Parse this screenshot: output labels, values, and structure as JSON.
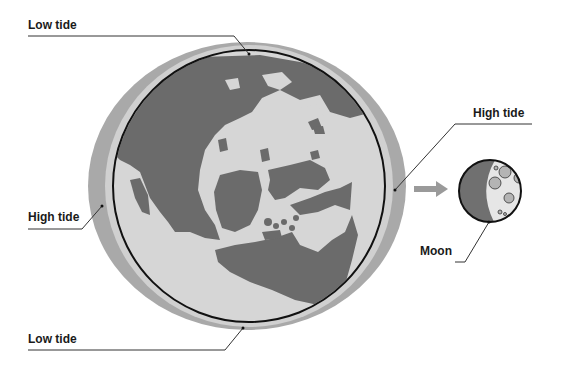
{
  "diagram": {
    "labels": {
      "low_tide_top": "Low tide",
      "high_tide_left": "High tide",
      "high_tide_right": "High tide",
      "low_tide_bottom": "Low tide",
      "moon": "Moon"
    },
    "elements": {
      "earth": "Earth with continents",
      "tidal_bulge": "Ocean bulge (ellipse)",
      "arrow": "arrow-right",
      "moon": "Moon with craters"
    },
    "colors": {
      "bulge": "#a9a9a9",
      "ring": "#d2d2d2",
      "ocean": "#d6d6d6",
      "land": "#6b6b6b",
      "outline": "#111111",
      "moon_dark": "#707070",
      "moon_light": "#e6e6e6",
      "crater": "#b4b4b4",
      "leader_line": "#333333",
      "arrow": "#9a9a9a"
    }
  }
}
